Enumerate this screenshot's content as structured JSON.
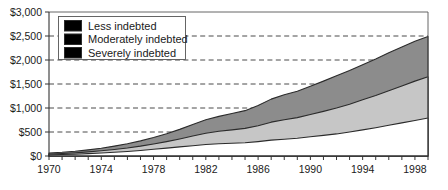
{
  "chart_data": {
    "type": "area",
    "stacked": true,
    "title": "",
    "subtitle": "",
    "xlabel": "",
    "ylabel": "",
    "xlim": [
      1970,
      1999
    ],
    "ylim": [
      0,
      3000
    ],
    "yticks": [
      0,
      500,
      1000,
      1500,
      2000,
      2500,
      3000
    ],
    "ytick_labels": [
      "$0",
      "$500",
      "$1,000",
      "$1,500",
      "$2,000",
      "$2,500",
      "$3,000"
    ],
    "xticks": [
      1970,
      1971,
      1972,
      1973,
      1974,
      1975,
      1976,
      1977,
      1978,
      1979,
      1980,
      1981,
      1982,
      1983,
      1984,
      1985,
      1986,
      1987,
      1988,
      1989,
      1990,
      1991,
      1992,
      1993,
      1994,
      1995,
      1996,
      1997,
      1998,
      1999
    ],
    "xtick_labels_shown": [
      "1970",
      "1974",
      "1978",
      "1982",
      "1986",
      "1990",
      "1994",
      "1998"
    ],
    "grid": "horizontal-dashed",
    "legend_position": "top-left-inside",
    "x": [
      1970,
      1971,
      1972,
      1973,
      1974,
      1975,
      1976,
      1977,
      1978,
      1979,
      1980,
      1981,
      1982,
      1983,
      1984,
      1985,
      1986,
      1987,
      1988,
      1989,
      1990,
      1991,
      1992,
      1993,
      1994,
      1995,
      1996,
      1997,
      1998,
      1999
    ],
    "series": [
      {
        "name": "Severely indebted",
        "color": "#ffffff",
        "values": [
          25,
          30,
          38,
          50,
          62,
          78,
          95,
          115,
          140,
          165,
          190,
          215,
          240,
          255,
          265,
          275,
          300,
          330,
          350,
          370,
          400,
          430,
          460,
          500,
          545,
          590,
          640,
          690,
          740,
          790
        ]
      },
      {
        "name": "Moderately indebted",
        "color": "#c6c6c6",
        "values": [
          18,
          22,
          28,
          36,
          46,
          58,
          72,
          90,
          110,
          135,
          165,
          200,
          235,
          260,
          280,
          300,
          330,
          375,
          405,
          430,
          465,
          500,
          540,
          580,
          625,
          670,
          720,
          770,
          820,
          860
        ]
      },
      {
        "name": "Less indebted",
        "color": "#8c8c8c",
        "values": [
          20,
          25,
          32,
          42,
          55,
          70,
          88,
          110,
          135,
          165,
          200,
          240,
          280,
          310,
          340,
          370,
          420,
          480,
          520,
          550,
          590,
          630,
          670,
          700,
          730,
          760,
          790,
          810,
          830,
          840
        ]
      }
    ],
    "stack_tops": {
      "severely_indebted": [
        25,
        30,
        38,
        50,
        62,
        78,
        95,
        115,
        140,
        165,
        190,
        215,
        240,
        255,
        265,
        275,
        300,
        330,
        350,
        370,
        400,
        430,
        460,
        500,
        545,
        590,
        640,
        690,
        740,
        790
      ],
      "moderately_indebted": [
        43,
        52,
        66,
        86,
        108,
        136,
        167,
        205,
        250,
        300,
        355,
        415,
        475,
        515,
        545,
        575,
        630,
        705,
        755,
        800,
        865,
        930,
        1000,
        1080,
        1170,
        1260,
        1360,
        1460,
        1560,
        1650
      ],
      "less_indebted": [
        63,
        77,
        98,
        128,
        163,
        206,
        255,
        315,
        385,
        465,
        555,
        655,
        755,
        825,
        885,
        945,
        1050,
        1185,
        1275,
        1350,
        1455,
        1560,
        1670,
        1780,
        1900,
        2020,
        2150,
        2270,
        2390,
        2490
      ]
    }
  },
  "legend": {
    "items": [
      {
        "label": "Less indebted",
        "swatch": "#8c8c8c"
      },
      {
        "label": "Moderately indebted",
        "swatch": "#c6c6c6"
      },
      {
        "label": "Severely indebted",
        "swatch": "#ffffff"
      }
    ]
  },
  "axes": {
    "y_labels": [
      "$3,000",
      "$2,500",
      "$2,000",
      "$1,500",
      "$1,000",
      "$500",
      "$0"
    ],
    "x_labels": [
      "1970",
      "1974",
      "1978",
      "1982",
      "1986",
      "1990",
      "1994",
      "1998"
    ]
  }
}
